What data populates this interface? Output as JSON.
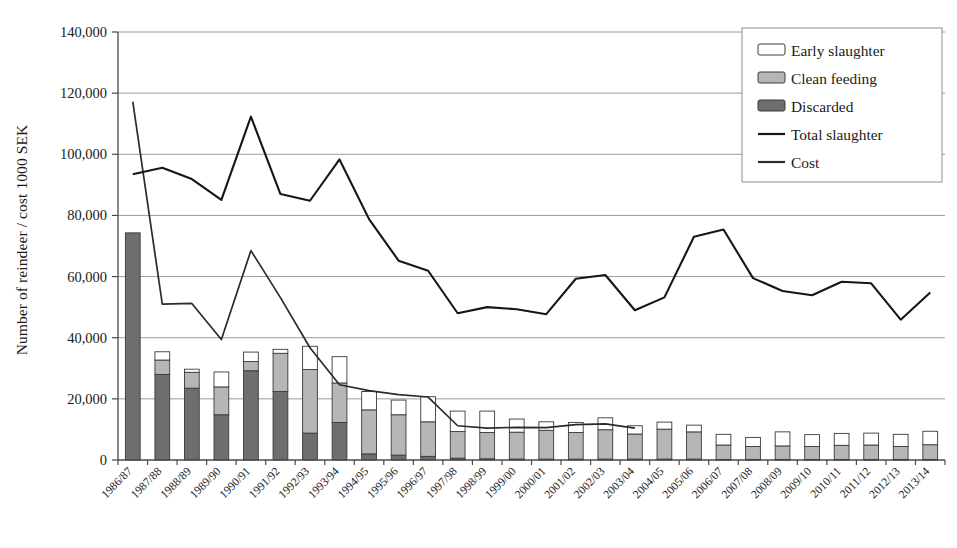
{
  "chart_data": {
    "type": "bar",
    "title": "",
    "xlabel": "",
    "ylabel": "Number of reindeer / cost 1000 SEK",
    "ylim": [
      0,
      140000
    ],
    "ytick_values": [
      0,
      20000,
      40000,
      60000,
      80000,
      100000,
      120000,
      140000
    ],
    "ytick_labels": [
      "0",
      "20,000",
      "40,000",
      "60,000",
      "80,000",
      "100,000",
      "120,000",
      "140,000"
    ],
    "grid": true,
    "legend_position": "top-right",
    "stacked": true,
    "categories": [
      "1986/87",
      "1987/88",
      "1988/89",
      "1989/90",
      "1990/91",
      "1991/92",
      "1992/93",
      "1993/94",
      "1994/95",
      "1995/96",
      "1996/97",
      "1997/98",
      "1998/99",
      "1999/00",
      "2000/01",
      "2001/02",
      "2002/03",
      "2003/04",
      "2004/05",
      "2005/06",
      "2006/07",
      "2007/08",
      "2008/09",
      "2009/10",
      "2010/11",
      "2011/12",
      "2012/13",
      "2013/14"
    ],
    "series": [
      {
        "name": "Discarded",
        "type": "bar-segment",
        "color": "#6e6e6e",
        "values": [
          74300,
          28000,
          23500,
          14800,
          29200,
          22400,
          8800,
          12300,
          2000,
          1600,
          1200,
          600,
          400,
          300,
          300,
          300,
          300,
          300,
          300,
          300,
          200,
          200,
          200,
          200,
          200,
          200,
          200,
          200
        ]
      },
      {
        "name": "Clean feeding",
        "type": "bar-segment",
        "color": "#b6b6b6",
        "values": [
          0,
          4700,
          5200,
          9100,
          3000,
          12500,
          20800,
          12900,
          14400,
          13200,
          11300,
          8700,
          8600,
          8800,
          9400,
          8700,
          9600,
          8200,
          9800,
          8900,
          4700,
          4200,
          4400,
          4200,
          4600,
          4700,
          4200,
          4800
        ]
      },
      {
        "name": "Early slaughter",
        "type": "bar-segment",
        "color": "#ffffff",
        "values": [
          0,
          2700,
          1000,
          4900,
          3100,
          1300,
          7600,
          8600,
          6000,
          4800,
          8200,
          6700,
          7000,
          4300,
          2800,
          3300,
          3900,
          2700,
          2300,
          2200,
          3500,
          3000,
          4600,
          3900,
          3900,
          3900,
          4000,
          4400
        ]
      },
      {
        "name": "Total slaughter",
        "type": "line",
        "color": "#161616",
        "values": [
          93500,
          95600,
          91900,
          85100,
          112300,
          87000,
          84800,
          98300,
          78800,
          65200,
          61900,
          48000,
          50000,
          49300,
          47700,
          59300,
          60500,
          49000,
          53200,
          73000,
          75400,
          59500,
          55300,
          53900,
          58300,
          57800,
          45900,
          54800
        ]
      },
      {
        "name": "Cost",
        "type": "line",
        "color": "#2b2b2b",
        "values": [
          117200,
          51000,
          51200,
          39400,
          68500,
          53100,
          36700,
          24600,
          22700,
          21400,
          20600,
          11200,
          10400,
          10700,
          10600,
          11600,
          11800,
          10400,
          0,
          0,
          0,
          0,
          0,
          0,
          0,
          0,
          0,
          0
        ]
      }
    ]
  },
  "legend": {
    "items": [
      {
        "label": "Early slaughter",
        "marker": "swatch",
        "color": "#ffffff"
      },
      {
        "label": "Clean feeding",
        "marker": "swatch",
        "color": "#b6b6b6"
      },
      {
        "label": "Discarded",
        "marker": "swatch",
        "color": "#6e6e6e"
      },
      {
        "label": "Total slaughter",
        "marker": "line",
        "color": "#161616"
      },
      {
        "label": "Cost",
        "marker": "line",
        "color": "#2b2b2b"
      }
    ]
  }
}
